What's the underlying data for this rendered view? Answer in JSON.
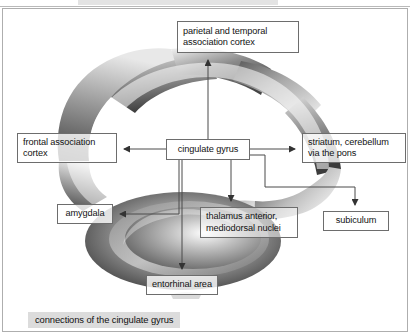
{
  "figure": {
    "caption": "connections of the cingulate gyrus",
    "border_color": "#aeaeae",
    "background": "#ffffff"
  },
  "nodes": [
    {
      "id": "parietal",
      "label_line1": "parietal and temporal",
      "label_line2": "association cortex"
    },
    {
      "id": "frontal",
      "label_line1": "frontal association",
      "label_line2": "cortex"
    },
    {
      "id": "cingulate",
      "label_line1": "cingulate gyrus",
      "label_line2": ""
    },
    {
      "id": "striatum",
      "label_line1": "striatum, cerebellum",
      "label_line2": "via the pons"
    },
    {
      "id": "amygdala",
      "label_line1": "amygdala",
      "label_line2": ""
    },
    {
      "id": "thalamus",
      "label_line1": "thalamus anterior,",
      "label_line2": "mediodorsal nuclei"
    },
    {
      "id": "subiculum",
      "label_line1": "subiculum",
      "label_line2": ""
    },
    {
      "id": "entorhinal",
      "label_line1": "entorhinal area",
      "label_line2": ""
    }
  ],
  "connections": [
    {
      "from": "cingulate",
      "to": "parietal",
      "direction": "up"
    },
    {
      "from": "cingulate",
      "to": "frontal",
      "direction": "left"
    },
    {
      "from": "cingulate",
      "to": "striatum",
      "direction": "right"
    },
    {
      "from": "cingulate",
      "to": "amygdala",
      "direction": "down-left"
    },
    {
      "from": "cingulate",
      "to": "thalamus",
      "direction": "down"
    },
    {
      "from": "cingulate",
      "to": "subiculum",
      "direction": "down-right"
    },
    {
      "from": "cingulate",
      "to": "entorhinal",
      "direction": "down"
    }
  ],
  "colors": {
    "line": "#4a4a4a",
    "box_border": "#6d6d6d",
    "caption_band": "#dcdcdc",
    "art_dark": "#4c4c4c",
    "art_mid": "#8e8e8e",
    "art_light": "#d8d8d8"
  }
}
